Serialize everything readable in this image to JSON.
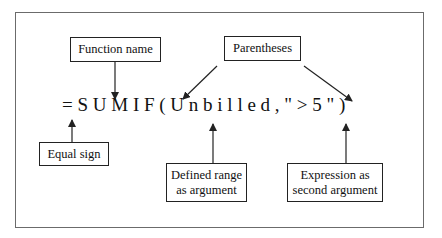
{
  "diagram": {
    "formula": {
      "text": "= S U M I F ( U n b i l l e d , \" > 5 \" )",
      "function_name": "SUMIF",
      "argument_range": "Unbilled",
      "argument_expression": "\">5\""
    },
    "labels": {
      "function_name": "Function name",
      "parentheses": "Parentheses",
      "equal_sign": "Equal sign",
      "defined_range_line1": "Defined range",
      "defined_range_line2": "as argument",
      "expression_line1": "Expression as",
      "expression_line2": "second argument"
    },
    "colors": {
      "stroke": "#222222",
      "frame": "#6b6b6b",
      "background": "#ffffff"
    }
  }
}
